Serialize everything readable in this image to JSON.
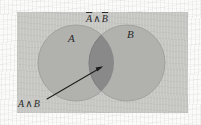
{
  "figure": {
    "type": "venn-diagram",
    "caption_text": null,
    "panel": {
      "background_color": "#c6c6c3",
      "x": 17,
      "y": 12,
      "width": 171,
      "height": 101
    },
    "page_background_color": "#fbfbfa",
    "circle_fill_color": "#b1b1ae",
    "circle_stroke_color": "#9a9a97",
    "intersection_fill_color": "#89898a",
    "arrow_color": "#1c1c1c",
    "text_color": "#2a2a2a"
  },
  "sets": [
    {
      "id": "A",
      "label": "A",
      "label_x": 72,
      "label_y": 40,
      "circle": {
        "cx": 76,
        "cy": 63,
        "r": 38
      }
    },
    {
      "id": "B",
      "label": "B",
      "label_x": 131,
      "label_y": 36,
      "circle": {
        "cx": 127,
        "cy": 63,
        "r": 38
      }
    }
  ],
  "labels": {
    "top": {
      "text": "A ∧ B",
      "a_term": "A",
      "operator": "∧",
      "b_term": "B",
      "a_overline": true,
      "b_overline": true,
      "description": "A-bar and B-bar",
      "x": 86,
      "y": 14
    },
    "bottom_left": {
      "text": "A ∧ B",
      "a_term": "A",
      "operator": "∧",
      "b_term": "B",
      "a_overline": false,
      "b_overline": false,
      "description": "A and B",
      "x": 18,
      "y": 99
    }
  },
  "annotations": [
    {
      "name": "intersection-pointer",
      "kind": "arrow",
      "from_label": "A ∧ B",
      "from_x": 47,
      "from_y": 99,
      "to_x": 102,
      "to_y": 67,
      "points_to": "intersection-region"
    }
  ]
}
